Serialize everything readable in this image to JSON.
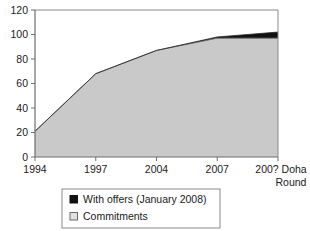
{
  "chart_data": {
    "type": "area",
    "title": "",
    "subtitle": "",
    "xlabel": "",
    "ylabel": "",
    "stacked": true,
    "grid": false,
    "legend_position": "bottom",
    "categories": [
      "1994",
      "1997",
      "2004",
      "2007",
      "200? Doha Round"
    ],
    "x_tick_labels": [
      "1994",
      "1997",
      "2004",
      "2007",
      "200? Doha"
    ],
    "x_tick_label_second_line": "Round",
    "y_tick_labels": [
      "0",
      "20",
      "40",
      "60",
      "80",
      "100",
      "120"
    ],
    "y_tick_values": [
      0,
      20,
      40,
      60,
      80,
      100,
      120
    ],
    "ylim": [
      0,
      120
    ],
    "series": [
      {
        "name": "Commitments",
        "color": "#c9c9c9",
        "values": [
          21,
          68,
          87,
          97,
          97
        ]
      },
      {
        "name": "With offers (January 2008)",
        "color": "#111111",
        "values": [
          0,
          0,
          0,
          1,
          5
        ]
      }
    ],
    "legend_entries": [
      {
        "label": "With offers (January 2008)",
        "swatch": "#111111",
        "swatch_border": "#111111"
      },
      {
        "label": "Commitments",
        "swatch": "#d9d9d9",
        "swatch_border": "#6b6b6b"
      }
    ]
  },
  "colors": {
    "axis": "#7a7a7a",
    "plot_border": "#8a8a8a",
    "commitments_fill": "#c9c9c9",
    "commitments_line": "#6e6e6e",
    "offers_fill": "#111111",
    "legend_border": "#8a8a8a",
    "text": "#1a1a1a",
    "background": "#ffffff"
  }
}
